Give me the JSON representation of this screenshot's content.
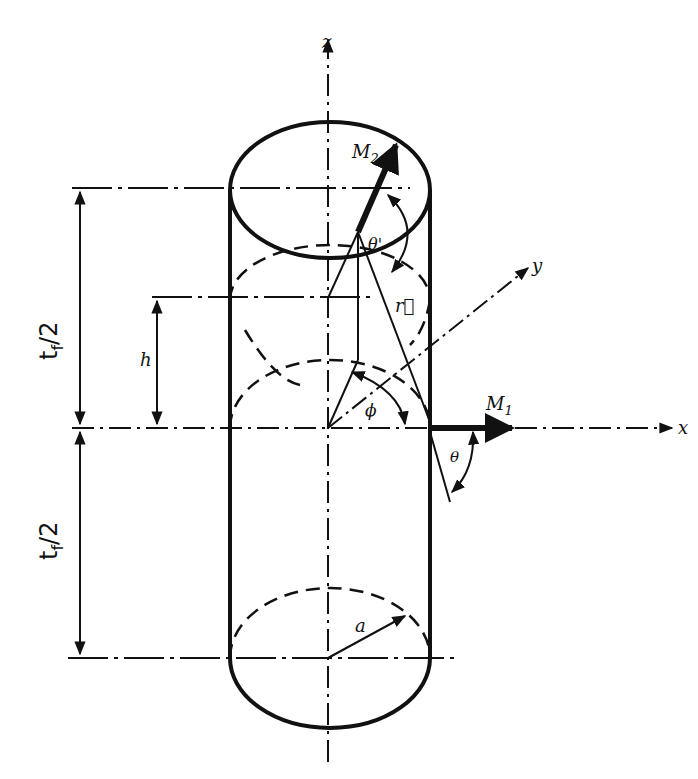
{
  "diagram": {
    "type": "cylinder-geometry",
    "colors": {
      "ink": "#111111",
      "background": "#ffffff"
    },
    "axes": {
      "x": {
        "label": "x"
      },
      "y": {
        "label": "y"
      },
      "z": {
        "label": "z"
      }
    },
    "vectors": {
      "m1": {
        "label_main": "M",
        "label_sub": "1"
      },
      "m2": {
        "label_main": "M",
        "label_sub": "2"
      },
      "r": {
        "label": "r⃗"
      }
    },
    "angles": {
      "theta": "θ",
      "theta_prime": "θ'",
      "phi": "ϕ"
    },
    "dimensions": {
      "upper_half": {
        "main": "t",
        "sub": "f",
        "rest": "/2"
      },
      "lower_half": {
        "main": "t",
        "sub": "f",
        "rest": "/2"
      },
      "height": "h",
      "radius": "a"
    }
  }
}
